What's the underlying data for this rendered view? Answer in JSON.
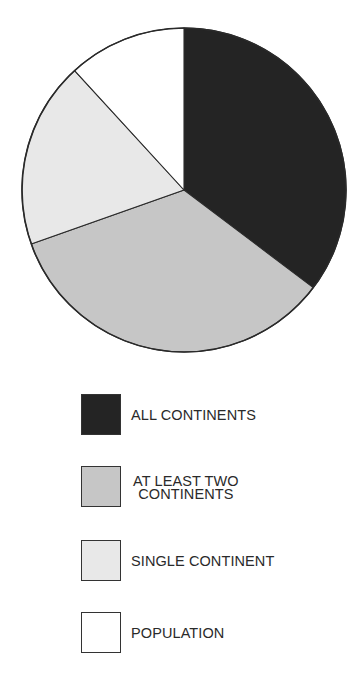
{
  "chart_data": {
    "type": "pie",
    "title": "",
    "start_angle_deg": 0,
    "direction": "clockwise",
    "units": "percent (estimated from slice angles)",
    "slices": [
      {
        "label": "ALL CONTINENTS",
        "value": 35.3,
        "color": "#242424"
      },
      {
        "label": "AT LEAST TWO CONTINENTS",
        "value": 34.3,
        "color": "#c6c6c6"
      },
      {
        "label": "SINGLE CONTINENT",
        "value": 18.6,
        "color": "#e8e8e8"
      },
      {
        "label": "POPULATION",
        "value": 11.8,
        "color": "#ffffff"
      }
    ],
    "legend_position": "below"
  },
  "legend": {
    "items": [
      {
        "label": "ALL CONTINENTS",
        "color": "#242424"
      },
      {
        "label": "AT LEAST TWO\nCONTINENTS",
        "color": "#c6c6c6"
      },
      {
        "label": "SINGLE CONTINENT",
        "color": "#e8e8e8"
      },
      {
        "label": "POPULATION",
        "color": "#ffffff"
      }
    ]
  },
  "pie": {
    "cx": 184,
    "cy": 190,
    "r": 162,
    "outline_color": "#2a2a2a"
  }
}
